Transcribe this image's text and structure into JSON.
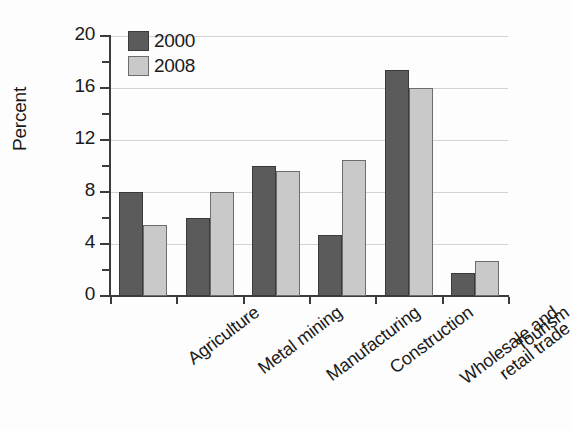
{
  "chart_data": {
    "type": "bar",
    "title": "",
    "subtitle": "",
    "xlabel": "",
    "ylabel": "Percent",
    "ylim": [
      0,
      20
    ],
    "ytick_major": [
      0,
      4,
      8,
      12,
      16,
      20
    ],
    "ytick_minor": [
      2,
      6,
      10,
      14,
      18
    ],
    "grid": "horizontal-major-only",
    "legend_position": "top-left-inside",
    "categories": [
      "Agriculture",
      "Metal mining",
      "Manufacturing",
      "Construction",
      "Wholesale and\nretail trade",
      "Tourism"
    ],
    "series": [
      {
        "name": "2000",
        "color": "#5b5b5b",
        "values": [
          8.0,
          6.0,
          10.0,
          4.7,
          17.4,
          1.8
        ]
      },
      {
        "name": "2008",
        "color": "#c9c9c9",
        "values": [
          5.5,
          8.0,
          9.6,
          10.5,
          16.0,
          2.7
        ]
      }
    ]
  },
  "axes": {
    "y_tick_labels": [
      "20",
      "16",
      "12",
      "8",
      "4",
      "0"
    ],
    "y_axis_title": "Percent"
  },
  "legend": {
    "entries": [
      {
        "label": "2000",
        "swatch": "dark-gray-swatch"
      },
      {
        "label": "2008",
        "swatch": "light-gray-swatch"
      }
    ]
  },
  "colors": {
    "series_2000": "#5b5b5b",
    "series_2008": "#c9c9c9",
    "axis": "#3b3b3b",
    "gridline": "#d2d2d2",
    "background": "#fdfdfd"
  }
}
